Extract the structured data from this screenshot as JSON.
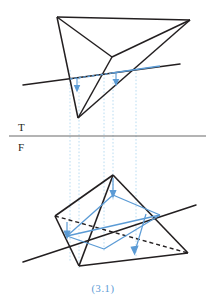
{
  "figure": {
    "caption": "(3.1)",
    "caption_color": "#5b9bd5",
    "background": "#ffffff",
    "line_color": "#231f20",
    "accent_color": "#5b9bd5",
    "projector_color": "#a8d4ef",
    "ground_line_color": "#6b6b6b"
  },
  "labels": {
    "top_view": "T",
    "front_view": "F"
  },
  "geometry": {
    "top_view": {
      "name": "top-view-tetrahedron",
      "vertices": {
        "a": [
          57,
          17
        ],
        "b": [
          190,
          20
        ],
        "c": [
          78,
          118
        ],
        "d": [
          112,
          57
        ]
      },
      "edges": [
        [
          "a",
          "b"
        ],
        [
          "a",
          "c"
        ],
        [
          "a",
          "d"
        ],
        [
          "b",
          "d"
        ],
        [
          "b",
          "c"
        ],
        [
          "c",
          "d"
        ]
      ],
      "cutting_line": [
        [
          23,
          85
        ],
        [
          180,
          64
        ]
      ],
      "cut_segment": [
        [
          70,
          79
        ],
        [
          136,
          70
        ]
      ],
      "arrows": [
        {
          "x": 77,
          "y_from": 78,
          "y_to": 90
        },
        {
          "x": 116,
          "y_from": 72,
          "y_to": 84
        }
      ]
    },
    "front_view": {
      "name": "front-view-tetrahedron",
      "vertices": {
        "a": [
          113,
          175
        ],
        "b": [
          55,
          216
        ],
        "c": [
          79,
          266
        ],
        "d": [
          188,
          253
        ],
        "e": [
          152,
          244
        ]
      },
      "edges": [
        [
          "a",
          "b"
        ],
        [
          "a",
          "c"
        ],
        [
          "a",
          "d"
        ],
        [
          "b",
          "c"
        ],
        [
          "c",
          "d"
        ]
      ],
      "hidden_edges": [
        [
          "b",
          "d"
        ]
      ],
      "cutting_line": [
        [
          23,
          262
        ],
        [
          196,
          205
        ]
      ],
      "cut_polygon": [
        [
          67,
          236
        ],
        [
          113,
          195
        ],
        [
          160,
          215
        ],
        [
          104,
          249
        ]
      ],
      "arrows": [
        {
          "x1": 113,
          "y1": 178,
          "x2": 113,
          "y2": 196
        },
        {
          "x1": 66,
          "y1": 222,
          "x2": 66,
          "y2": 238
        },
        {
          "x1": 146,
          "y1": 215,
          "x2": 135,
          "y2": 253
        }
      ]
    },
    "ground_line": {
      "name": "tf-reference-line",
      "points": [
        [
          9,
          136
        ],
        [
          206,
          136
        ]
      ]
    },
    "projectors": {
      "name": "vertical-projector-lines",
      "x_positions": [
        70,
        79,
        104,
        113,
        136
      ],
      "y_top": 70,
      "y_bottom": 270
    }
  }
}
